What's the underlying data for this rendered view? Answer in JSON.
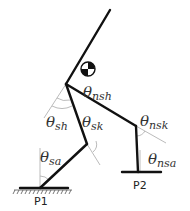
{
  "diagram": {
    "colors": {
      "link": "#111111",
      "guide": "#aaaaaa",
      "text": "#333333"
    },
    "labels": {
      "theta_nsh": {
        "symbol": "θ",
        "sub": "nsh"
      },
      "theta_sh": {
        "symbol": "θ",
        "sub": "sh"
      },
      "theta_sk": {
        "symbol": "θ",
        "sub": "sk"
      },
      "theta_nsk": {
        "symbol": "θ",
        "sub": "nsk"
      },
      "theta_sa": {
        "symbol": "θ",
        "sub": "sa"
      },
      "theta_nsa": {
        "symbol": "θ",
        "sub": "nsa"
      }
    },
    "points": {
      "p1": "P1",
      "p2": "P2"
    },
    "center_of_mass_icon": "center-of-mass-icon"
  }
}
